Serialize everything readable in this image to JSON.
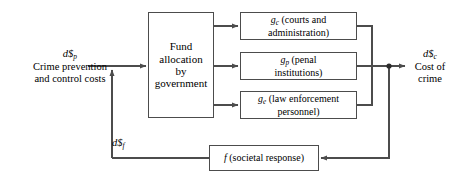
{
  "diagram": {
    "type": "block-diagram",
    "colors": {
      "line": "#4c4c4c",
      "box_border": "#4c4c4c",
      "background": "#ffffff",
      "text": "#000000"
    }
  },
  "nodes": {
    "fund_allocation": {
      "label": "Fund allocation by government",
      "line1": "Fund",
      "line2": "allocation",
      "line3": "by",
      "line4": "government"
    },
    "courts": {
      "symbol": "g",
      "subscript": "c",
      "description": "(courts and administration)",
      "line1": "(courts and",
      "line2": "administration)"
    },
    "penal": {
      "symbol": "g",
      "subscript": "p",
      "description": "(penal institutions)",
      "line1": "(penal",
      "line2": "institutions)"
    },
    "enforcement": {
      "symbol": "g",
      "subscript": "e",
      "description": "(law enforcement personnel)",
      "line1": "(law enforcement",
      "line2": "personnel)"
    },
    "societal": {
      "symbol": "f",
      "description": "(societal response)",
      "text": "(societal response)"
    }
  },
  "labels": {
    "input": {
      "symbol": "d$",
      "subscript": "p",
      "line1": "Crime prevention",
      "line2": "and control costs"
    },
    "output": {
      "symbol": "d$",
      "subscript": "c",
      "line1": "Cost of",
      "line2": "crime"
    },
    "feedback": {
      "symbol": "d$",
      "subscript": "f"
    }
  },
  "connections": [
    {
      "name": "input-to-fund",
      "from": "d$_p input",
      "to": "fund_allocation",
      "arrow": true
    },
    {
      "name": "feedback-into-input",
      "from": "f (societal response)",
      "to": "input summing point",
      "arrow": true
    },
    {
      "name": "fund-to-courts",
      "from": "fund_allocation",
      "to": "g_c",
      "arrow": true
    },
    {
      "name": "fund-to-penal",
      "from": "fund_allocation",
      "to": "g_p",
      "arrow": true
    },
    {
      "name": "fund-to-enforcement",
      "from": "fund_allocation",
      "to": "g_e",
      "arrow": true
    },
    {
      "name": "courts-to-sum",
      "from": "g_c",
      "to": "output junction",
      "arrow": false
    },
    {
      "name": "penal-to-sum",
      "from": "g_p",
      "to": "output junction",
      "arrow": false
    },
    {
      "name": "enforcement-to-sum",
      "from": "g_e",
      "to": "output junction",
      "arrow": false
    },
    {
      "name": "junction-to-output",
      "from": "output junction",
      "to": "d$_c cost of crime",
      "arrow": true
    },
    {
      "name": "junction-to-societal",
      "from": "output junction",
      "to": "f (societal response)",
      "arrow": true
    }
  ]
}
